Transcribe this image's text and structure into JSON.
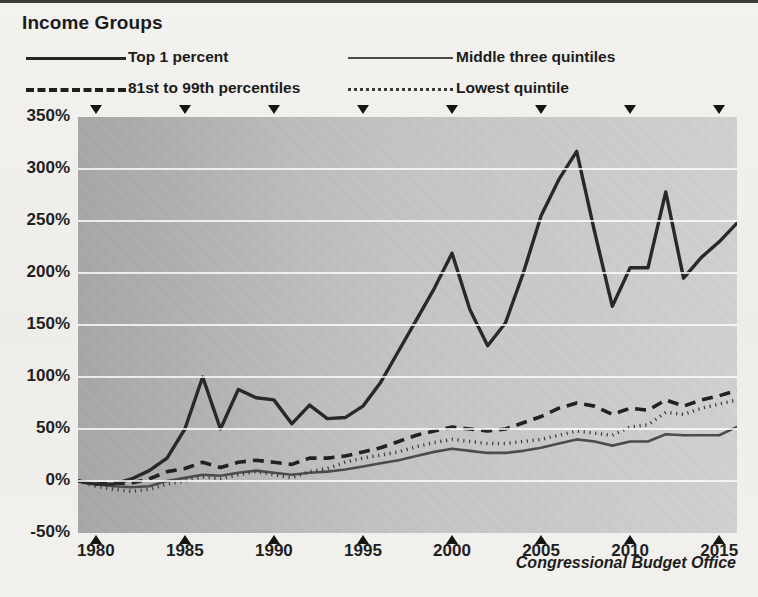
{
  "title": "Income Groups",
  "source": "Congressional Budget Office",
  "legend": [
    {
      "label": "Top 1 percent",
      "style": "solid-thick",
      "color": "#262626"
    },
    {
      "label": "Middle three quintiles",
      "style": "solid-thin",
      "color": "#4a4a4a"
    },
    {
      "label": "81st to 99th percentiles",
      "style": "dashed",
      "color": "#1f1f1f"
    },
    {
      "label": "Lowest quintile",
      "style": "dotted",
      "color": "#3a3a3a"
    }
  ],
  "axis": {
    "y_ticks": [
      "350%",
      "300%",
      "250%",
      "200%",
      "150%",
      "100%",
      "50%",
      "0%",
      "-50%"
    ],
    "x_ticks": [
      "1980",
      "1985",
      "1990",
      "1995",
      "2000",
      "2005",
      "2010",
      "2015"
    ]
  },
  "chart_data": {
    "type": "line",
    "title": "Income Groups",
    "xlabel": "",
    "ylabel": "",
    "xlim": [
      1979,
      2016
    ],
    "ylim": [
      -50,
      350
    ],
    "ytick_values": [
      350,
      300,
      250,
      200,
      150,
      100,
      50,
      0,
      -50
    ],
    "xtick_values": [
      1980,
      1985,
      1990,
      1995,
      2000,
      2005,
      2010,
      2015
    ],
    "grid": true,
    "legend_position": "above-plot",
    "annotation": "Congressional Budget Office",
    "x": [
      1979,
      1980,
      1981,
      1982,
      1983,
      1984,
      1985,
      1986,
      1987,
      1988,
      1989,
      1990,
      1991,
      1992,
      1993,
      1994,
      1995,
      1996,
      1997,
      1998,
      1999,
      2000,
      2001,
      2002,
      2003,
      2004,
      2005,
      2006,
      2007,
      2008,
      2009,
      2010,
      2011,
      2012,
      2013,
      2014,
      2015,
      2016
    ],
    "series": [
      {
        "name": "Top 1 percent",
        "style": "solid-thick",
        "color": "#262626",
        "values": [
          0,
          -3,
          -3,
          2,
          10,
          22,
          50,
          100,
          50,
          88,
          80,
          78,
          55,
          73,
          60,
          61,
          72,
          95,
          125,
          155,
          185,
          219,
          165,
          130,
          152,
          200,
          255,
          290,
          317,
          240,
          168,
          205,
          205,
          278,
          195,
          215,
          230,
          248
        ]
      },
      {
        "name": "81st to 99th percentiles",
        "style": "dashed",
        "color": "#1f1f1f",
        "values": [
          0,
          -3,
          -2,
          -2,
          2,
          9,
          12,
          18,
          13,
          18,
          20,
          18,
          16,
          22,
          22,
          24,
          28,
          32,
          38,
          44,
          48,
          52,
          50,
          48,
          50,
          56,
          62,
          70,
          75,
          72,
          64,
          70,
          68,
          78,
          72,
          78,
          82,
          87
        ]
      },
      {
        "name": "Lowest quintile",
        "style": "dotted",
        "color": "#3a3a3a",
        "values": [
          0,
          -5,
          -8,
          -10,
          -8,
          -3,
          0,
          4,
          2,
          6,
          9,
          6,
          3,
          9,
          12,
          18,
          22,
          25,
          28,
          33,
          37,
          40,
          38,
          36,
          36,
          38,
          40,
          44,
          48,
          46,
          44,
          52,
          54,
          66,
          64,
          70,
          74,
          78
        ]
      },
      {
        "name": "Middle three quintiles",
        "style": "solid-thin",
        "color": "#4a4a4a",
        "values": [
          0,
          -3,
          -5,
          -6,
          -5,
          0,
          3,
          6,
          5,
          8,
          10,
          8,
          6,
          8,
          9,
          11,
          14,
          17,
          20,
          24,
          28,
          31,
          29,
          27,
          27,
          29,
          32,
          36,
          40,
          38,
          34,
          38,
          38,
          45,
          44,
          44,
          44,
          52
        ]
      }
    ]
  }
}
